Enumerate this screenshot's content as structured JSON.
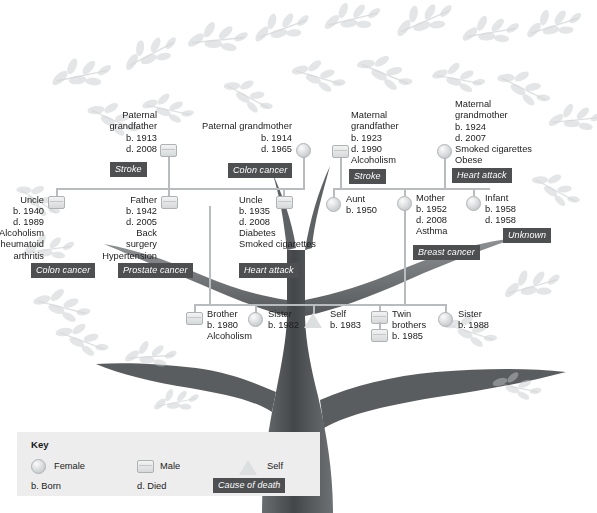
{
  "diagram": {
    "line_color": "#b9bcbe",
    "badge_color": "#4d4f51",
    "trunk_color": "#4a4c4e",
    "leaf_color": "#c8cbcd"
  },
  "generations": {
    "grandparents": [
      {
        "id": "paternal-grandfather",
        "sex": "male",
        "relation": "Paternal\ngrandfather",
        "born": "b. 1913",
        "died": "d. 2008",
        "conditions": "",
        "cause_of_death": "Stroke"
      },
      {
        "id": "paternal-grandmother",
        "sex": "female",
        "relation": "Paternal grandmother",
        "born": "b. 1914",
        "died": "d. 1965",
        "conditions": "",
        "cause_of_death": "Colon cancer"
      },
      {
        "id": "maternal-grandfather",
        "sex": "male",
        "relation": "Maternal\ngrandfather",
        "born": "b. 1923",
        "died": "d. 1990",
        "conditions": "Alcoholism",
        "cause_of_death": "Stroke"
      },
      {
        "id": "maternal-grandmother",
        "sex": "female",
        "relation": "Maternal\ngrandmother",
        "born": "b. 1924",
        "died": "d. 2007",
        "conditions": "Smoked cigarettes\nObese",
        "cause_of_death": "Heart attack"
      }
    ],
    "parents": [
      {
        "id": "paternal-uncle-1940",
        "sex": "male",
        "relation": "Uncle",
        "born": "b. 1940",
        "died": "d. 1989",
        "conditions": "Alcoholism\nRheumatoid\narthritis",
        "cause_of_death": "Colon cancer"
      },
      {
        "id": "father",
        "sex": "male",
        "relation": "Father",
        "born": "b. 1942",
        "died": "d. 2005",
        "conditions": "Back\nsurgery\nHypertension",
        "cause_of_death": "Prostate cancer"
      },
      {
        "id": "paternal-uncle-1935",
        "sex": "male",
        "relation": "Uncle",
        "born": "b. 1935",
        "died": "d. 2008",
        "conditions": "Diabetes\nSmoked cigarettes",
        "cause_of_death": "Heart attack"
      },
      {
        "id": "aunt",
        "sex": "female",
        "relation": "Aunt",
        "born": "b. 1950",
        "died": "",
        "conditions": "",
        "cause_of_death": ""
      },
      {
        "id": "mother",
        "sex": "female",
        "relation": "Mother",
        "born": "b. 1952",
        "died": "d. 2008",
        "conditions": "Asthma",
        "cause_of_death": "Breast cancer"
      },
      {
        "id": "infant",
        "sex": "female",
        "relation": "Infant",
        "born": "b. 1958",
        "died": "d. 1958",
        "conditions": "",
        "cause_of_death": "Unknown"
      }
    ],
    "siblings": [
      {
        "id": "brother",
        "sex": "male",
        "relation": "Brother",
        "born": "b. 1980",
        "conditions": "Alcoholism"
      },
      {
        "id": "sister-1982",
        "sex": "female",
        "relation": "Sister",
        "born": "b. 1982",
        "conditions": ""
      },
      {
        "id": "self",
        "sex": "self",
        "relation": "Self",
        "born": "b. 1983",
        "conditions": ""
      },
      {
        "id": "twin-brothers",
        "sex": "male-twins",
        "relation": "Twin\nbrothers",
        "born": "b. 1985",
        "conditions": ""
      },
      {
        "id": "sister-1988",
        "sex": "female",
        "relation": "Sister",
        "born": "b. 1988",
        "conditions": ""
      }
    ]
  },
  "key": {
    "title": "Key",
    "female": "Female",
    "male": "Male",
    "self": "Self",
    "born": "b. Born",
    "died": "d. Died",
    "cause_of_death": "Cause of death"
  }
}
